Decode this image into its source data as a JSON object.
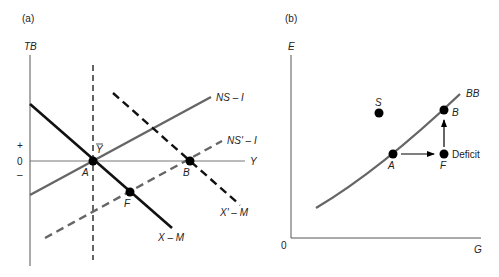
{
  "panels": {
    "a": {
      "tag": "(a)",
      "y_axis_label": "TB",
      "x_axis_label": "Y",
      "ticks": {
        "plus": "+",
        "zero": "0",
        "minus": "–"
      },
      "curves": {
        "x_minus_m": "X – M",
        "x_prime_minus_m": "X' – M",
        "ns_minus_i": "NS – I",
        "ns_prime_minus_i": "NS' – I"
      },
      "ybar_label": "Y",
      "points": {
        "a": "A",
        "b": "B",
        "f": "F"
      }
    },
    "b": {
      "tag": "(b)",
      "y_axis_label": "E",
      "x_axis_label": "G",
      "origin_label": "0",
      "curve_label": "BB",
      "points": {
        "s": "S",
        "b": "B",
        "a": "A",
        "f": "F"
      },
      "deficit_label": "Deficit"
    }
  },
  "colors": {
    "axis": "#555555",
    "black_curve": "#111111",
    "gray_curve": "#666666",
    "point": "#000000"
  }
}
